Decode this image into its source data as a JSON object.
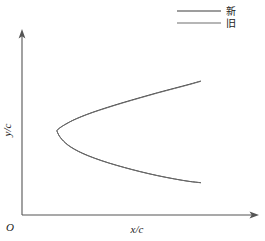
{
  "chart_data": {
    "type": "line",
    "title": "",
    "xlabel": "x/c",
    "ylabel": "y/c",
    "origin_label": "O",
    "grid": false,
    "legend_position": "top-right",
    "xlim": [
      0,
      1.15
    ],
    "ylim": [
      -0.55,
      0.65
    ],
    "axis_style": "arrowed-half-axes",
    "series": [
      {
        "name": "新",
        "color": "#3c3c3c",
        "linewidth": 1.0,
        "description": "new airfoil profile, closed contour from trailing edge upper, around leading edge, to trailing edge lower",
        "x": [
          1.0,
          0.92,
          0.82,
          0.7,
          0.58,
          0.46,
          0.35,
          0.25,
          0.17,
          0.11,
          0.07,
          0.04,
          0.02,
          0.008,
          0.002,
          0.0,
          0.004,
          0.012,
          0.025,
          0.045,
          0.075,
          0.12,
          0.18,
          0.26,
          0.36,
          0.47,
          0.58,
          0.7,
          0.82,
          0.92,
          1.0
        ],
        "y": [
          0.455,
          0.425,
          0.39,
          0.348,
          0.303,
          0.257,
          0.212,
          0.168,
          0.128,
          0.093,
          0.065,
          0.042,
          0.024,
          0.012,
          0.003,
          -0.004,
          -0.02,
          -0.042,
          -0.068,
          -0.098,
          -0.133,
          -0.172,
          -0.212,
          -0.255,
          -0.3,
          -0.342,
          -0.38,
          -0.417,
          -0.448,
          -0.47,
          -0.482
        ]
      },
      {
        "name": "旧",
        "color": "#6e6e6e",
        "linewidth": 0.9,
        "description": "old airfoil profile, nearly coincident with new profile, slightly offset near leading edge and lower surface",
        "x": [
          1.0,
          0.92,
          0.82,
          0.7,
          0.58,
          0.46,
          0.35,
          0.25,
          0.17,
          0.11,
          0.07,
          0.04,
          0.02,
          0.008,
          0.002,
          0.0,
          0.005,
          0.014,
          0.028,
          0.048,
          0.078,
          0.123,
          0.183,
          0.263,
          0.363,
          0.472,
          0.582,
          0.702,
          0.822,
          0.922,
          1.0
        ],
        "y": [
          0.452,
          0.422,
          0.387,
          0.345,
          0.3,
          0.254,
          0.209,
          0.166,
          0.126,
          0.092,
          0.064,
          0.041,
          0.023,
          0.011,
          0.002,
          -0.006,
          -0.024,
          -0.047,
          -0.073,
          -0.103,
          -0.138,
          -0.176,
          -0.216,
          -0.258,
          -0.302,
          -0.344,
          -0.382,
          -0.418,
          -0.449,
          -0.471,
          -0.483
        ]
      }
    ]
  },
  "legend": {
    "items": [
      {
        "label": "新",
        "color": "#3c3c3c"
      },
      {
        "label": "旧",
        "color": "#6e6e6e"
      }
    ]
  },
  "axes": {
    "x_label": "x/c",
    "y_label": "y/c",
    "origin": "O"
  }
}
